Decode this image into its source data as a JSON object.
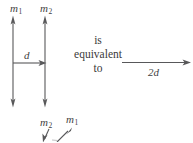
{
  "figure": {
    "background_color": "#ffffff",
    "stroke_color": "#58585a",
    "text_color": "#3a3a3a"
  },
  "left_diagram": {
    "top_labels": [
      {
        "name": "m1",
        "text": "m",
        "sub": "1",
        "x": 10,
        "y": 3
      },
      {
        "name": "m2",
        "text": "m",
        "sub": "2",
        "x": 40,
        "y": 3
      }
    ],
    "vectors": [
      {
        "name": "left-vector",
        "x": 13,
        "y_top": 18,
        "y_bottom": 105
      },
      {
        "name": "right-vector",
        "x": 45,
        "y_top": 18,
        "y_bottom": 105
      }
    ],
    "distance": {
      "label": "d",
      "label_x": 24,
      "label_y": 50,
      "line_y": 63,
      "x_start": 13,
      "x_end": 45
    }
  },
  "equivalence_text": {
    "lines": [
      "is",
      "equivalent",
      "to"
    ],
    "center_x": 98,
    "top_y": 33
  },
  "right_diagram": {
    "arrow": {
      "name": "combined-vector",
      "y": 63,
      "x_start": 122,
      "x_end": 190
    },
    "label": "2d",
    "label_x": 148,
    "label_y": 67
  },
  "bottom_labels": [
    {
      "name": "m2-bottom",
      "text": "m",
      "sub": "2",
      "x": 40,
      "y": 117
    },
    {
      "name": "m1-bottom",
      "text": "m",
      "sub": "1",
      "x": 66,
      "y": 114
    }
  ],
  "bottom_arrows": [
    {
      "name": "m2-bottom-arrow",
      "x1": 47,
      "y1": 130,
      "x2": 42,
      "y2": 142
    },
    {
      "name": "m1-bottom-arrow",
      "x1": 58,
      "y1": 142,
      "x2": 72,
      "y2": 129
    }
  ]
}
